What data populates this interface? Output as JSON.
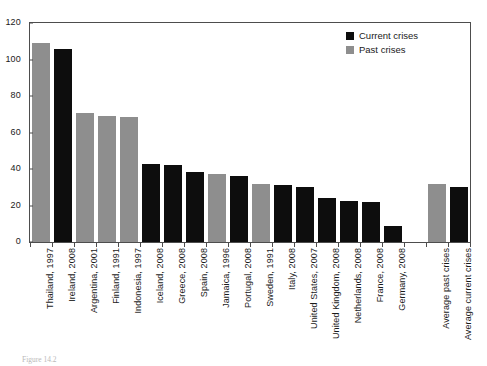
{
  "chart_data": {
    "type": "bar",
    "title": "",
    "subtitle": "",
    "xlabel": "",
    "ylabel": "",
    "ylim": [
      0,
      120
    ],
    "y_ticks": [
      0,
      20,
      40,
      60,
      80,
      100,
      120
    ],
    "grid": false,
    "legend_position": "top-right",
    "categories": [
      "Thailand, 1997",
      "Ireland, 2008",
      "Argentina, 2001",
      "Finland, 1991",
      "Indonesia, 1997",
      "Iceland, 2008",
      "Greece, 2008",
      "Spain, 2008",
      "Jamaica, 1996",
      "Portugal, 2008",
      "Sweden, 1991",
      "Italy, 2008",
      "United States, 2007",
      "United Kingdom, 2008",
      "Netherlands, 2008",
      "France, 2008",
      "Germany, 2008",
      "",
      "Average past crises",
      "Average current crises"
    ],
    "values": [
      109,
      106,
      70.5,
      69,
      68.5,
      42.5,
      42,
      38.5,
      37.5,
      36,
      32,
      31,
      30,
      24,
      22.5,
      22,
      9,
      null,
      32,
      30
    ],
    "series_of_bar": [
      "past",
      "current",
      "past",
      "past",
      "past",
      "current",
      "current",
      "current",
      "past",
      "current",
      "past",
      "current",
      "current",
      "current",
      "current",
      "current",
      "current",
      null,
      "past",
      "current"
    ],
    "legend": [
      {
        "label": "Current crises",
        "color": "#0d0d0d",
        "key": "current"
      },
      {
        "label": "Past crises",
        "color": "#8e8e8e",
        "key": "past"
      }
    ]
  },
  "legend": {
    "current_label": "Current crises",
    "past_label": "Past crises"
  },
  "caption": {
    "text": "Figure 14.2"
  }
}
